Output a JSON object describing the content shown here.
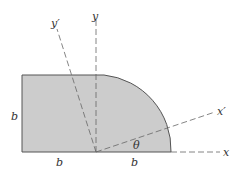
{
  "diagram": {
    "colors": {
      "fill": "#cccccc",
      "stroke": "#555555",
      "axis": "#666666"
    },
    "labels": {
      "y_prime": "y′",
      "y": "y",
      "x_prime": "x′",
      "x": "x",
      "theta": "θ",
      "left_height": "b",
      "bottom_left": "b",
      "bottom_right": "b"
    }
  }
}
